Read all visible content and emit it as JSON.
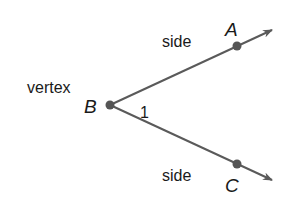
{
  "diagram": {
    "type": "angle",
    "colors": {
      "ray": "#5a5a5a",
      "point": "#555555",
      "text": "#1a1a1a",
      "background": "#ffffff"
    },
    "labels": {
      "vertex_term": "vertex",
      "side_top": "side",
      "side_bottom": "side",
      "vertex_point": "B",
      "point_top": "A",
      "point_bottom": "C",
      "angle_number": "1"
    },
    "points": {
      "B": [
        110,
        105
      ],
      "A": [
        237,
        46
      ],
      "C": [
        237,
        164
      ]
    },
    "rays": [
      {
        "from": "B",
        "through": "A",
        "arrow_tip": [
          272,
          30
        ]
      },
      {
        "from": "B",
        "through": "C",
        "arrow_tip": [
          272,
          180
        ]
      }
    ]
  }
}
